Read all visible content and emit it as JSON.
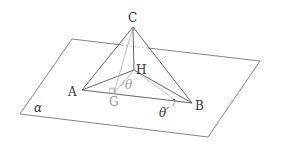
{
  "diagram": {
    "type": "3d-geometry",
    "colors": {
      "line": "#555555",
      "light_line": "#a8a8a8",
      "plane": "#666666",
      "text": "#333333",
      "light_text": "#9a9a9a"
    },
    "points": {
      "C": {
        "label": "C",
        "x": 133,
        "y": 27
      },
      "H": {
        "label": "H",
        "x": 134,
        "y": 70
      },
      "A": {
        "label": "A",
        "x": 82,
        "y": 90
      },
      "B": {
        "label": "B",
        "x": 192,
        "y": 103
      },
      "G": {
        "label": "G",
        "x": 114,
        "y": 93
      }
    },
    "plane": {
      "label": "α",
      "corners": [
        [
          72,
          39
        ],
        [
          260,
          61
        ],
        [
          208,
          137
        ],
        [
          20,
          114
        ]
      ]
    },
    "angles": {
      "theta": "θ",
      "theta_prime": "θ′"
    },
    "segments": [
      "CA",
      "CB",
      "CH",
      "AH",
      "BH",
      "AB",
      "CG",
      "HG"
    ]
  }
}
